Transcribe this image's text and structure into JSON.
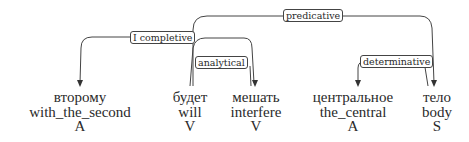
{
  "diagram": {
    "type": "dependency-parse",
    "tokens": [
      {
        "word": "второму",
        "gloss": "with_the_second",
        "pos": "A"
      },
      {
        "word": "будет",
        "gloss": "will",
        "pos": "V"
      },
      {
        "word": "мешать",
        "gloss": "interfere",
        "pos": "V"
      },
      {
        "word": "центральное",
        "gloss": "the_central",
        "pos": "A"
      },
      {
        "word": "тело",
        "gloss": "body",
        "pos": "S"
      }
    ],
    "relations": [
      {
        "label": "predicative",
        "head": "будет",
        "dependent": "тело"
      },
      {
        "label": "I completive",
        "head": "будет",
        "dependent": "второму"
      },
      {
        "label": "analytical",
        "head": "будет",
        "dependent": "мешать"
      },
      {
        "label": "determinative",
        "head": "тело",
        "dependent": "центральное"
      }
    ]
  }
}
